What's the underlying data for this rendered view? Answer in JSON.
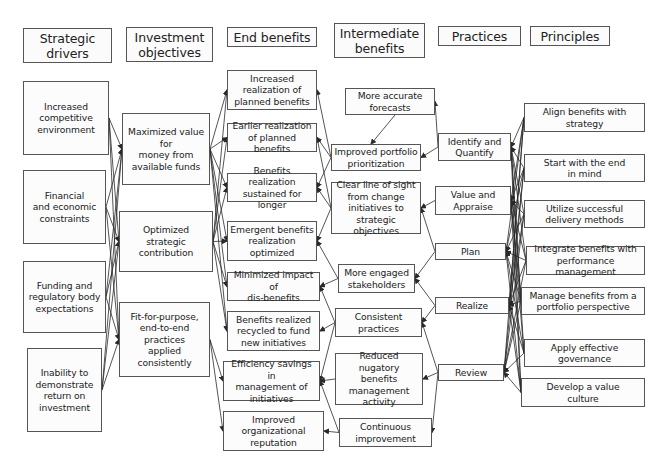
{
  "diagram": {
    "headers": [
      {
        "id": "h-drivers",
        "label": "Strategic\ndrivers",
        "box": [
          23,
          28,
          89,
          35
        ]
      },
      {
        "id": "h-objectives",
        "label": "Investment\nobjectives",
        "box": [
          126,
          27,
          87,
          35
        ]
      },
      {
        "id": "h-end",
        "label": "End benefits",
        "box": [
          227,
          27,
          90,
          20
        ]
      },
      {
        "id": "h-intermediate",
        "label": "Intermediate\nbenefits",
        "box": [
          334,
          23,
          91,
          35
        ]
      },
      {
        "id": "h-practices",
        "label": "Practices",
        "box": [
          438,
          26,
          83,
          20
        ]
      },
      {
        "id": "h-principles",
        "label": "Principles",
        "box": [
          530,
          26,
          80,
          20
        ]
      }
    ],
    "strategic_drivers": [
      {
        "id": "d1",
        "label": "Increased\ncompetitive\nenvironment",
        "box": [
          23,
          81,
          86,
          74
        ]
      },
      {
        "id": "d2",
        "label": "Financial\nand economic\nconstraints",
        "box": [
          23,
          170,
          83,
          74
        ]
      },
      {
        "id": "d3",
        "label": "Funding and\nregulatory body\nexpectations",
        "box": [
          23,
          261,
          83,
          72
        ]
      },
      {
        "id": "d4",
        "label": "Inability to\ndemonstrate\nreturn on\ninvestment",
        "box": [
          27,
          348,
          75,
          84
        ]
      }
    ],
    "investment_objectives": [
      {
        "id": "o1",
        "label": "Maximized value\nfor\nmoney from\navailable funds",
        "box": [
          122,
          113,
          88,
          72
        ]
      },
      {
        "id": "o2",
        "label": "Optimized\nstrategic\ncontribution",
        "box": [
          119,
          211,
          94,
          61
        ]
      },
      {
        "id": "o3",
        "label": "Fit-for-purpose,\nend-to-end\npractices\napplied\nconsistently",
        "box": [
          119,
          302,
          91,
          75
        ]
      }
    ],
    "end_benefits": [
      {
        "id": "e1",
        "label": "Increased\nrealization of\nplanned benefits",
        "box": [
          227,
          70,
          90,
          40
        ]
      },
      {
        "id": "e2",
        "label": "Earlier realization\nof planned benefits",
        "box": [
          227,
          123,
          90,
          29
        ]
      },
      {
        "id": "e3",
        "label": "Benefits realization\nsustained for longer",
        "box": [
          227,
          173,
          90,
          29
        ]
      },
      {
        "id": "e4",
        "label": "Emergent benefits\nrealization\noptimized",
        "box": [
          227,
          221,
          90,
          40
        ]
      },
      {
        "id": "e5",
        "label": "Minimized impact of\ndis-benefits",
        "box": [
          227,
          272,
          93,
          29
        ]
      },
      {
        "id": "e6",
        "label": "Benefits realized\nrecycled to fund\nnew initiatives",
        "box": [
          227,
          311,
          93,
          40
        ]
      },
      {
        "id": "e7",
        "label": "Efficiency savings in\nmanagement of\ninitiatives",
        "box": [
          223,
          361,
          97,
          40
        ]
      },
      {
        "id": "e8",
        "label": "Improved\norganizational\nreputation",
        "box": [
          223,
          411,
          101,
          40
        ]
      }
    ],
    "intermediate_benefits": [
      {
        "id": "i1",
        "label": "More accurate\nforecasts",
        "box": [
          345,
          88,
          90,
          27
        ]
      },
      {
        "id": "i2",
        "label": "Improved portfolio\nprioritization",
        "box": [
          331,
          144,
          90,
          27
        ]
      },
      {
        "id": "i3",
        "label": "Clear line of sight\nfrom change\ninitiatives to\nstrategic objectives",
        "box": [
          331,
          182,
          90,
          52
        ]
      },
      {
        "id": "i4",
        "label": "More engaged\nstakeholders",
        "box": [
          338,
          264,
          77,
          29
        ]
      },
      {
        "id": "i5",
        "label": "Consistent\npractices",
        "box": [
          335,
          308,
          87,
          29
        ]
      },
      {
        "id": "i6",
        "label": "Reduced nugatory\nbenefits\nmanagement\nactivity",
        "box": [
          335,
          353,
          88,
          52
        ]
      },
      {
        "id": "i7",
        "label": "Continuous\nimprovement",
        "box": [
          339,
          418,
          93,
          29
        ]
      }
    ],
    "practices": [
      {
        "id": "p1",
        "label": "Identify and\nQuantify",
        "box": [
          438,
          133,
          73,
          28
        ]
      },
      {
        "id": "p2",
        "label": "Value and\nAppraise",
        "box": [
          435,
          186,
          76,
          29
        ]
      },
      {
        "id": "p3",
        "label": "Plan",
        "box": [
          435,
          243,
          71,
          17
        ]
      },
      {
        "id": "p4",
        "label": "Realize",
        "box": [
          435,
          297,
          74,
          17
        ]
      },
      {
        "id": "p5",
        "label": "Review",
        "box": [
          438,
          364,
          66,
          17
        ]
      }
    ],
    "principles": [
      {
        "id": "r1",
        "label": "Align benefits with\nstrategy",
        "box": [
          524,
          103,
          121,
          29
        ]
      },
      {
        "id": "r2",
        "label": "Start with the end\nin mind",
        "box": [
          524,
          154,
          121,
          28
        ]
      },
      {
        "id": "r3",
        "label": "Utilize successful\ndelivery methods",
        "box": [
          524,
          200,
          121,
          28
        ]
      },
      {
        "id": "r4",
        "label": "Integrate benefits with\nperformance management",
        "box": [
          526,
          246,
          119,
          29
        ]
      },
      {
        "id": "r5",
        "label": "Manage benefits from a\nportfolio perspective",
        "box": [
          521,
          287,
          124,
          28
        ]
      },
      {
        "id": "r6",
        "label": "Apply effective\ngovernance",
        "box": [
          524,
          339,
          121,
          28
        ]
      },
      {
        "id": "r7",
        "label": "Develop a value\nculture",
        "box": [
          521,
          378,
          124,
          29
        ]
      }
    ],
    "links": [
      [
        "d1",
        "o1"
      ],
      [
        "d1",
        "o2"
      ],
      [
        "d1",
        "o3"
      ],
      [
        "d2",
        "o1"
      ],
      [
        "d2",
        "o2"
      ],
      [
        "d2",
        "o3"
      ],
      [
        "d3",
        "o1"
      ],
      [
        "d3",
        "o2"
      ],
      [
        "d3",
        "o3"
      ],
      [
        "d4",
        "o1"
      ],
      [
        "d4",
        "o2"
      ],
      [
        "d4",
        "o3"
      ],
      [
        "o1",
        "e1"
      ],
      [
        "o1",
        "e2"
      ],
      [
        "o1",
        "e3"
      ],
      [
        "o1",
        "e4"
      ],
      [
        "o1",
        "e5"
      ],
      [
        "o1",
        "e6"
      ],
      [
        "o2",
        "e1"
      ],
      [
        "o2",
        "e2"
      ],
      [
        "o2",
        "e3"
      ],
      [
        "o2",
        "e4"
      ],
      [
        "o2",
        "e5"
      ],
      [
        "o2",
        "e6"
      ],
      [
        "o3",
        "e7"
      ],
      [
        "o3",
        "e8"
      ],
      [
        "i1",
        "i2"
      ],
      [
        "i2",
        "e1"
      ],
      [
        "i2",
        "e2"
      ],
      [
        "i2",
        "e3"
      ],
      [
        "i3",
        "e2"
      ],
      [
        "i3",
        "e3"
      ],
      [
        "i3",
        "e4"
      ],
      [
        "i4",
        "e4"
      ],
      [
        "i4",
        "e5"
      ],
      [
        "i5",
        "e5"
      ],
      [
        "i5",
        "e6"
      ],
      [
        "i5",
        "e7"
      ],
      [
        "i6",
        "e7"
      ],
      [
        "i7",
        "e7"
      ],
      [
        "i7",
        "e8"
      ],
      [
        "p1",
        "i1"
      ],
      [
        "p1",
        "i2"
      ],
      [
        "p2",
        "i3"
      ],
      [
        "p3",
        "i3"
      ],
      [
        "p3",
        "i4"
      ],
      [
        "p4",
        "i4"
      ],
      [
        "p4",
        "i5"
      ],
      [
        "p5",
        "i6"
      ],
      [
        "p5",
        "i5"
      ],
      [
        "p5",
        "i7"
      ],
      [
        "r1",
        "p1"
      ],
      [
        "r1",
        "p2"
      ],
      [
        "r1",
        "p3"
      ],
      [
        "r1",
        "p4"
      ],
      [
        "r1",
        "p5"
      ],
      [
        "r2",
        "p1"
      ],
      [
        "r2",
        "p2"
      ],
      [
        "r2",
        "p3"
      ],
      [
        "r2",
        "p4"
      ],
      [
        "r2",
        "p5"
      ],
      [
        "r3",
        "p1"
      ],
      [
        "r3",
        "p2"
      ],
      [
        "r3",
        "p3"
      ],
      [
        "r3",
        "p4"
      ],
      [
        "r3",
        "p5"
      ],
      [
        "r4",
        "p1"
      ],
      [
        "r4",
        "p2"
      ],
      [
        "r4",
        "p3"
      ],
      [
        "r4",
        "p4"
      ],
      [
        "r4",
        "p5"
      ],
      [
        "r5",
        "p1"
      ],
      [
        "r5",
        "p2"
      ],
      [
        "r5",
        "p3"
      ],
      [
        "r5",
        "p4"
      ],
      [
        "r5",
        "p5"
      ],
      [
        "r6",
        "p1"
      ],
      [
        "r6",
        "p2"
      ],
      [
        "r6",
        "p3"
      ],
      [
        "r6",
        "p4"
      ],
      [
        "r6",
        "p5"
      ],
      [
        "r7",
        "p1"
      ],
      [
        "r7",
        "p2"
      ],
      [
        "r7",
        "p3"
      ],
      [
        "r7",
        "p4"
      ],
      [
        "r7",
        "p5"
      ]
    ],
    "colors": {
      "line": "#2a2a2a",
      "border": "#555555",
      "box_fill": "#fcfcfc"
    }
  }
}
